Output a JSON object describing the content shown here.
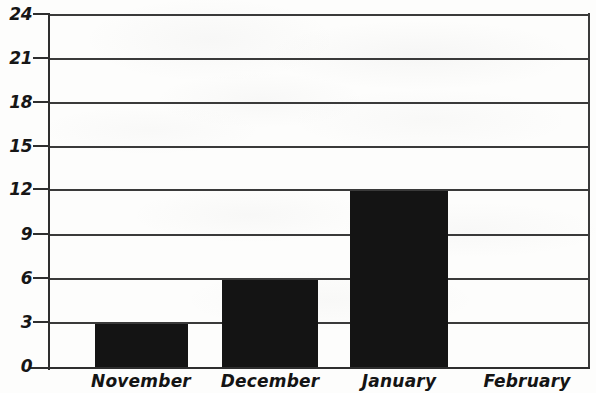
{
  "chart_data": {
    "type": "bar",
    "title": "",
    "subtitle": "",
    "xlabel": "",
    "ylabel": "",
    "categories": [
      "November",
      "December",
      "January",
      "February"
    ],
    "values": [
      3,
      6,
      12,
      0
    ],
    "series": [
      {
        "name": "",
        "values": [
          3,
          6,
          12,
          0
        ]
      }
    ],
    "ylim": [
      0,
      24
    ],
    "ytick_labels": [
      "24",
      "21",
      "18",
      "15",
      "12",
      "9",
      "6",
      "3",
      "0"
    ],
    "ytick_values": [
      24,
      21,
      18,
      15,
      12,
      9,
      6,
      3,
      0
    ],
    "ytick_step": 3,
    "grid": "horizontal",
    "legend": "none",
    "bar_color": "#141414",
    "gridline_color": "#3a3a3a",
    "axis_color": "#2e2e2e",
    "background_color": "#fdfdfc",
    "annotations": []
  },
  "axes": {
    "y": {
      "ticks": [
        {
          "label": "24",
          "value": 24
        },
        {
          "label": "21",
          "value": 21
        },
        {
          "label": "18",
          "value": 18
        },
        {
          "label": "15",
          "value": 15
        },
        {
          "label": "12",
          "value": 12
        },
        {
          "label": "9",
          "value": 9
        },
        {
          "label": "6",
          "value": 6
        },
        {
          "label": "3",
          "value": 3
        },
        {
          "label": "0",
          "value": 0
        }
      ]
    },
    "x": {
      "ticks": [
        {
          "label": "November"
        },
        {
          "label": "December"
        },
        {
          "label": "January"
        },
        {
          "label": "February"
        }
      ]
    }
  }
}
